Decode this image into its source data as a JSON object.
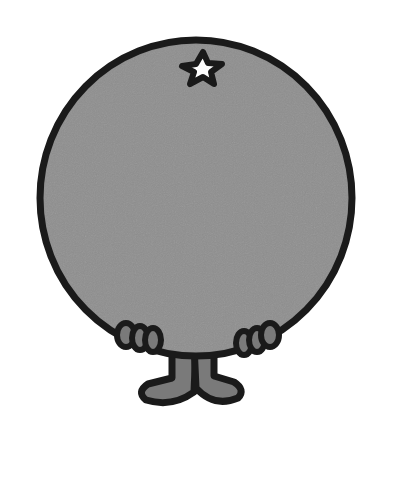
{
  "illustration": {
    "subject": "round grey cartoon character with star on top, small hands and feet",
    "colors": {
      "background": "#ffffff",
      "body_fill": "#8e8e8e",
      "outline": "#1a1a1a",
      "feet_fill": "#7a7a7a",
      "star_fill": "#ffffff"
    }
  }
}
